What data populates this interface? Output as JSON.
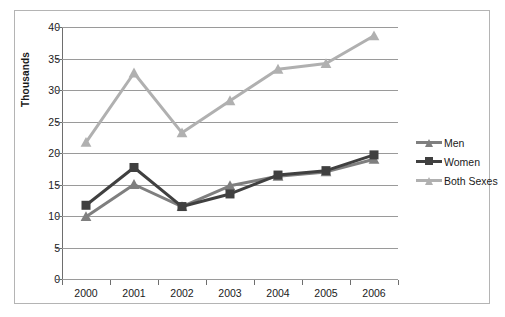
{
  "chart_data": {
    "type": "line",
    "title": "",
    "xlabel": "",
    "ylabel": "Thousands",
    "categories": [
      "2000",
      "2001",
      "2002",
      "2003",
      "2004",
      "2005",
      "2006"
    ],
    "ylim": [
      0,
      40
    ],
    "ytick_step": 5,
    "yticks": [
      "40",
      "35",
      "30",
      "25",
      "20",
      "15",
      "10",
      "5",
      "0"
    ],
    "grid": true,
    "legend_position": "right",
    "series": [
      {
        "name": "Men",
        "color": "#7f7f7f",
        "marker": "triangle",
        "values": [
          9.9,
          15.0,
          11.5,
          14.8,
          16.3,
          17.0,
          19.0
        ]
      },
      {
        "name": "Women",
        "color": "#404040",
        "marker": "square",
        "values": [
          11.7,
          17.7,
          11.5,
          13.5,
          16.5,
          17.2,
          19.7
        ]
      },
      {
        "name": "Both Sexes",
        "color": "#b0b0b0",
        "marker": "triangle",
        "values": [
          21.7,
          32.7,
          23.2,
          28.3,
          33.3,
          34.2,
          38.6
        ]
      }
    ]
  },
  "legend": {
    "items": [
      {
        "label": "Men"
      },
      {
        "label": "Women"
      },
      {
        "label": "Both Sexes"
      }
    ]
  },
  "axes": {
    "y_title": "Thousands"
  }
}
